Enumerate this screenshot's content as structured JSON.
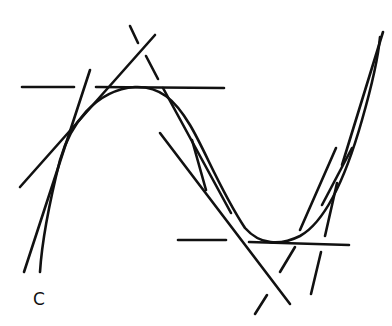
{
  "diagram": {
    "title": "",
    "curve_label": "C",
    "stroke_color": "#111111",
    "background_color": "#ffffff",
    "elements": [
      {
        "type": "curve",
        "name": "curve-C"
      },
      {
        "type": "tangent",
        "name": "tangent-left-steep"
      },
      {
        "type": "tangent",
        "name": "tangent-left-diagonal"
      },
      {
        "type": "tangent",
        "name": "tangent-horizontal-top"
      },
      {
        "type": "tangent",
        "name": "tangent-top-right-broken"
      },
      {
        "type": "tangent",
        "name": "tangent-middle-descending"
      },
      {
        "type": "tangent",
        "name": "tangent-middle-inner"
      },
      {
        "type": "tangent",
        "name": "tangent-horizontal-bottom"
      },
      {
        "type": "tangent",
        "name": "tangent-right-broken-1"
      },
      {
        "type": "tangent",
        "name": "tangent-right-broken-2"
      },
      {
        "type": "tangent",
        "name": "tangent-right-steep"
      }
    ]
  }
}
